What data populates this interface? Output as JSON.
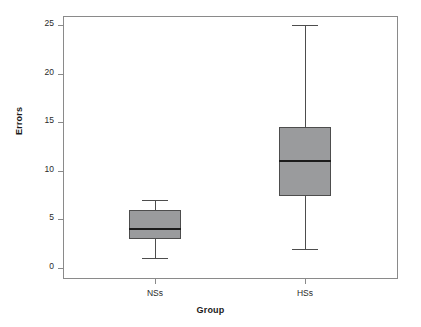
{
  "chart_data": {
    "type": "box",
    "title": "",
    "xlabel": "Group",
    "ylabel": "Errors",
    "categories": [
      "NSs",
      "HSs"
    ],
    "ylim": [
      0,
      25
    ],
    "yticks": [
      0,
      5,
      10,
      15,
      20,
      25
    ],
    "ytick_labels": [
      "0",
      "5",
      "10",
      "15",
      "20",
      "25"
    ],
    "grid": false,
    "legend": false,
    "box_fill_color": "#9a9b9d",
    "box_edge_color": "#4d4d4d",
    "median_color": "#1c1c1c",
    "frame_color": "#8a8a8a",
    "boxes": [
      {
        "label": "NSs",
        "whisker_low": 1,
        "q1": 3,
        "median": 4,
        "q3": 6,
        "whisker_high": 7,
        "outliers": []
      },
      {
        "label": "HSs",
        "whisker_low": 2,
        "q1": 7.4,
        "median": 11,
        "q3": 14.5,
        "whisker_high": 25,
        "outliers": []
      }
    ]
  },
  "axes": {
    "y_title": "Errors",
    "x_title": "Group"
  }
}
